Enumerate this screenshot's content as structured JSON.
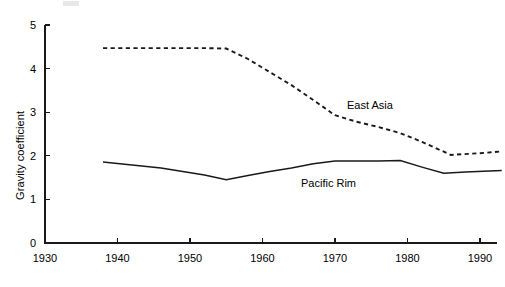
{
  "chart_data": {
    "type": "line",
    "title": "",
    "xlabel": "",
    "ylabel": "Gravity coefficient",
    "xlim": [
      1930,
      1993
    ],
    "ylim": [
      0,
      5
    ],
    "grid": false,
    "legend_position": "inline-annotation",
    "x_ticks": [
      1930,
      1940,
      1950,
      1960,
      1970,
      1980,
      1990
    ],
    "x_tick_labels": [
      "1930",
      "1940",
      "1950",
      "1960",
      "1970",
      "1980",
      "1990"
    ],
    "y_ticks": [
      0,
      1,
      2,
      3,
      4,
      5
    ],
    "y_tick_labels": [
      "0",
      "1",
      "2",
      "3",
      "4",
      "5"
    ],
    "series": [
      {
        "name": "East Asia",
        "style": "dashed",
        "color": "#1a1a1a",
        "annotation": "East Asia",
        "x": [
          1938,
          1946,
          1952,
          1955,
          1958,
          1961,
          1964,
          1967,
          1970,
          1973,
          1976,
          1979,
          1982,
          1986,
          1990,
          1993
        ],
        "values": [
          4.47,
          4.47,
          4.47,
          4.46,
          4.22,
          3.92,
          3.62,
          3.28,
          2.93,
          2.78,
          2.66,
          2.52,
          2.32,
          2.02,
          2.06,
          2.1
        ]
      },
      {
        "name": "Pacific Rim",
        "style": "solid",
        "color": "#1a1a1a",
        "annotation": "Pacific Rim",
        "x": [
          1938,
          1946,
          1952,
          1955,
          1958,
          1961,
          1964,
          1967,
          1970,
          1973,
          1976,
          1979,
          1982,
          1985,
          1988,
          1993
        ],
        "values": [
          1.86,
          1.72,
          1.56,
          1.45,
          1.55,
          1.64,
          1.72,
          1.82,
          1.88,
          1.88,
          1.88,
          1.89,
          1.74,
          1.6,
          1.63,
          1.66
        ]
      }
    ]
  },
  "axis": {
    "y_label": "Gravity coefficient"
  },
  "annotations": {
    "east_asia": "East Asia",
    "pacific_rim": "Pacific Rim"
  }
}
